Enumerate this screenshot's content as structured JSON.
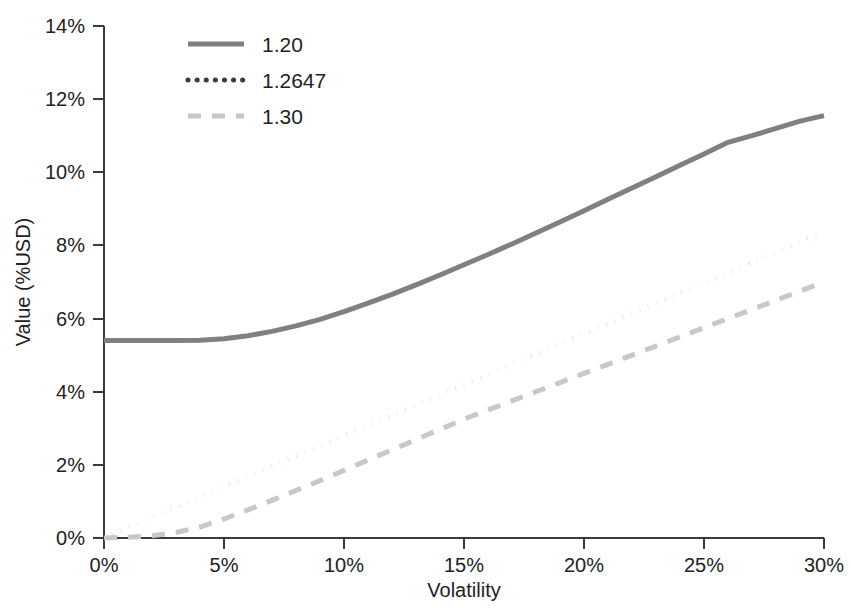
{
  "chart_data": {
    "type": "line",
    "title": "",
    "xlabel": "Volatility",
    "ylabel": "Value (%USD)",
    "xlim": [
      0,
      30
    ],
    "ylim": [
      0,
      14
    ],
    "grid": false,
    "legend_position": "top-left-inside",
    "x_tick_labels": [
      "0%",
      "5%",
      "10%",
      "15%",
      "20%",
      "25%",
      "30%"
    ],
    "x_ticks": [
      0,
      5,
      10,
      15,
      20,
      25,
      30
    ],
    "y_tick_labels": [
      "0%",
      "2%",
      "4%",
      "6%",
      "8%",
      "10%",
      "12%",
      "14%"
    ],
    "y_ticks": [
      0,
      2,
      4,
      6,
      8,
      10,
      12,
      14
    ],
    "x": [
      0,
      1,
      2,
      3,
      4,
      5,
      6,
      7,
      8,
      9,
      10,
      11,
      12,
      13,
      14,
      15,
      16,
      17,
      18,
      19,
      20,
      21,
      22,
      23,
      24,
      25,
      26,
      27,
      28,
      29,
      30
    ],
    "series": [
      {
        "name": "1.20",
        "style": "solid",
        "color": "#808080",
        "values": [
          5.4,
          5.4,
          5.4,
          5.4,
          5.41,
          5.45,
          5.53,
          5.65,
          5.8,
          5.98,
          6.19,
          6.42,
          6.66,
          6.92,
          7.19,
          7.47,
          7.75,
          8.04,
          8.34,
          8.64,
          8.95,
          9.26,
          9.57,
          9.88,
          10.19,
          10.5,
          10.82,
          11.0,
          11.2,
          11.4,
          11.55
        ]
      },
      {
        "name": "1.2647",
        "style": "dotted",
        "color": "#3c3c3c",
        "values": [
          0.0,
          0.28,
          0.56,
          0.84,
          1.12,
          1.4,
          1.68,
          1.96,
          2.24,
          2.52,
          2.8,
          3.08,
          3.36,
          3.64,
          3.92,
          4.19,
          4.47,
          4.75,
          5.03,
          5.31,
          5.59,
          5.86,
          6.14,
          6.42,
          6.7,
          6.98,
          7.25,
          7.53,
          7.81,
          8.09,
          8.37
        ]
      },
      {
        "name": "1.30",
        "style": "dashed",
        "color": "#c8c8c8",
        "values": [
          0.0,
          0.02,
          0.06,
          0.15,
          0.3,
          0.52,
          0.77,
          1.03,
          1.3,
          1.57,
          1.85,
          2.13,
          2.41,
          2.69,
          2.97,
          3.25,
          3.5,
          3.75,
          4.0,
          4.25,
          4.5,
          4.75,
          5.0,
          5.25,
          5.5,
          5.75,
          6.0,
          6.25,
          6.5,
          6.75,
          7.0
        ]
      }
    ]
  },
  "axes": {
    "x_title": "Volatility",
    "y_title": "Value (%USD)",
    "x_ticks": [
      {
        "label": "0%"
      },
      {
        "label": "5%"
      },
      {
        "label": "10%"
      },
      {
        "label": "15%"
      },
      {
        "label": "20%"
      },
      {
        "label": "25%"
      },
      {
        "label": "30%"
      }
    ],
    "y_ticks": [
      {
        "label": "0%"
      },
      {
        "label": "2%"
      },
      {
        "label": "4%"
      },
      {
        "label": "6%"
      },
      {
        "label": "8%"
      },
      {
        "label": "10%"
      },
      {
        "label": "12%"
      },
      {
        "label": "14%"
      }
    ]
  },
  "legend": {
    "items": [
      {
        "label": "1.20",
        "style": "solid",
        "color": "#808080"
      },
      {
        "label": "1.2647",
        "style": "dotted",
        "color": "#3c3c3c"
      },
      {
        "label": "1.30",
        "style": "dashed",
        "color": "#c8c8c8"
      }
    ]
  }
}
